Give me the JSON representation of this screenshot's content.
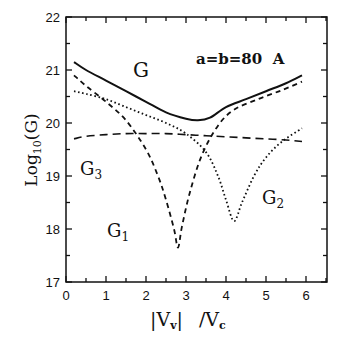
{
  "chart_data": {
    "type": "line",
    "title": "",
    "annotation": "a=b=80 A",
    "xlabel": "|V_v| /V_c",
    "ylabel": "Log10(G)",
    "xlim": [
      0,
      6.5
    ],
    "ylim": [
      17,
      22
    ],
    "xticks": [
      "0",
      "1",
      "2",
      "3",
      "4",
      "5",
      "6"
    ],
    "yticks": [
      "17",
      "18",
      "19",
      "20",
      "21",
      "22"
    ],
    "grid": false,
    "legend": "inline labels",
    "series": [
      {
        "name": "G",
        "style": "solid",
        "x": [
          0.2,
          0.5,
          1.0,
          1.5,
          2.0,
          2.5,
          3.0,
          3.3,
          3.6,
          4.0,
          4.5,
          5.0,
          5.5,
          5.9
        ],
        "y": [
          21.15,
          21.0,
          20.8,
          20.6,
          20.4,
          20.2,
          20.08,
          20.05,
          20.1,
          20.3,
          20.45,
          20.6,
          20.75,
          20.9
        ]
      },
      {
        "name": "G1",
        "style": "dashed",
        "x": [
          0.2,
          0.5,
          1.0,
          1.5,
          2.0,
          2.3,
          2.5,
          2.7,
          2.8,
          2.9,
          3.1,
          3.4,
          3.8,
          4.2,
          4.8,
          5.4,
          5.9
        ],
        "y": [
          20.9,
          20.7,
          20.4,
          20.05,
          19.5,
          19.0,
          18.55,
          18.0,
          17.65,
          18.05,
          18.7,
          19.4,
          19.95,
          20.25,
          20.45,
          20.62,
          20.78
        ]
      },
      {
        "name": "G2",
        "style": "dotted",
        "x": [
          0.2,
          0.5,
          1.0,
          1.5,
          2.0,
          2.5,
          3.0,
          3.5,
          3.8,
          4.0,
          4.2,
          4.4,
          4.7,
          5.0,
          5.4,
          5.9
        ],
        "y": [
          20.6,
          20.55,
          20.45,
          20.3,
          20.15,
          20.0,
          19.8,
          19.45,
          19.0,
          18.55,
          18.15,
          18.5,
          19.0,
          19.35,
          19.65,
          19.9
        ]
      },
      {
        "name": "G3",
        "style": "dashed-long",
        "x": [
          0.2,
          0.5,
          1.0,
          1.5,
          2.0,
          2.5,
          3.0,
          3.5,
          4.0,
          4.5,
          5.0,
          5.5,
          5.9
        ],
        "y": [
          19.7,
          19.75,
          19.78,
          19.8,
          19.8,
          19.8,
          19.78,
          19.76,
          19.74,
          19.72,
          19.7,
          19.68,
          19.65
        ]
      }
    ],
    "labels": {
      "G": "G",
      "G1": "G",
      "G1_sub": "1",
      "G2": "G",
      "G2_sub": "2",
      "G3": "G",
      "G3_sub": "3"
    }
  },
  "axis_text": {
    "ylabel_main": "Log",
    "ylabel_sub": "10",
    "ylabel_tail": "(G)",
    "xlabel_left": "|V",
    "xlabel_left_sub": "v",
    "xlabel_mid": "|",
    "xlabel_right": "/V",
    "xlabel_right_sub": "c",
    "annotation": "a=b=80  A"
  }
}
